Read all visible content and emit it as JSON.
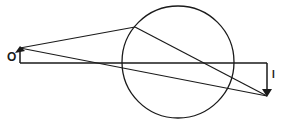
{
  "diagram": {
    "type": "optics-ray-diagram",
    "labels": {
      "object": "O",
      "image": "I"
    },
    "colors": {
      "stroke": "#1a1a1a",
      "background": "#ffffff"
    },
    "geometry": {
      "circle": {
        "cx": 178,
        "cy": 62,
        "r": 56
      },
      "axis_y": 63,
      "object_arrow": {
        "x": 20,
        "y_base": 63,
        "y_tip": 48
      },
      "image_arrow": {
        "x": 267,
        "y_base": 63,
        "y_tip": 96
      },
      "refraction_point": {
        "x": 135,
        "y": 27
      }
    }
  }
}
